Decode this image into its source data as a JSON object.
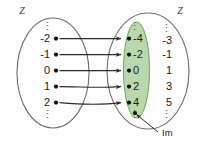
{
  "figure": {
    "type": "function-mapping-diagram",
    "background_color": "#fdfdfd"
  },
  "domain_set": {
    "label": "Z",
    "ellipsis_top": "⋮",
    "ellipsis_bottom": "⋮",
    "elements": [
      "-2",
      "-1",
      "0",
      "1",
      "2"
    ]
  },
  "codomain_set": {
    "label": "Z",
    "image_subset": {
      "name": "Im",
      "fill_color": "#b9d8ae",
      "stroke_color": "#77a86a",
      "ellipsis_top": "⋮",
      "ellipsis_bottom": "⋮",
      "elements": [
        "-4",
        "-2",
        "0",
        "2",
        "4"
      ]
    },
    "outside_elements": {
      "ellipsis_top": "⋮",
      "ellipsis_bottom": "⋮",
      "elements": [
        "-3",
        "-1",
        "1",
        "3",
        "5"
      ]
    }
  },
  "mappings": [
    {
      "from": "-2",
      "to": "-4"
    },
    {
      "from": "-1",
      "to": "-2"
    },
    {
      "from": "0",
      "to": "0"
    },
    {
      "from": "1",
      "to": "2"
    },
    {
      "from": "2",
      "to": "4"
    }
  ],
  "annotation": {
    "label": "Im",
    "target": "image-subset-ellipse"
  }
}
